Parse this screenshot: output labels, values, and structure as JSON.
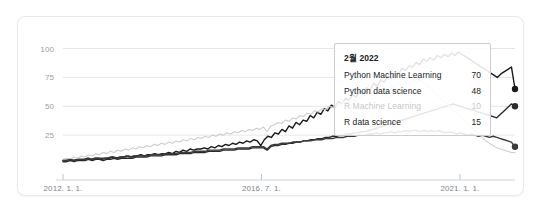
{
  "chart_data": {
    "type": "line",
    "title": "",
    "xlabel": "",
    "ylabel": "",
    "ylim": [
      0,
      110
    ],
    "grid": true,
    "legend_position": "tooltip",
    "y_ticks": [
      {
        "label": "100",
        "value": 100
      },
      {
        "label": "75",
        "value": 75
      },
      {
        "label": "50",
        "value": 50
      },
      {
        "label": "25",
        "value": 25
      }
    ],
    "x_ticks": [
      {
        "label": "2012. 1. 1.",
        "value": 0
      },
      {
        "label": "2016. 7. 1.",
        "value": 54
      },
      {
        "label": "2021. 1. 1.",
        "value": 108
      }
    ],
    "x_range": [
      0,
      123
    ],
    "series": [
      {
        "name": "Python Machine Learning",
        "color": "#1a1a1a",
        "endpoint_marker": true,
        "values": [
          3,
          3,
          4,
          3,
          4,
          4,
          4,
          5,
          4,
          5,
          5,
          4,
          5,
          5,
          6,
          5,
          6,
          6,
          7,
          6,
          7,
          7,
          8,
          7,
          8,
          8,
          9,
          8,
          9,
          9,
          10,
          9,
          11,
          10,
          12,
          11,
          13,
          12,
          13,
          13,
          14,
          13,
          15,
          14,
          16,
          15,
          17,
          16,
          18,
          17,
          19,
          18,
          20,
          19,
          21,
          20,
          16,
          21,
          24,
          23,
          27,
          26,
          30,
          28,
          33,
          31,
          36,
          34,
          38,
          37,
          42,
          40,
          45,
          43,
          48,
          46,
          51,
          49,
          54,
          52,
          57,
          55,
          60,
          58,
          63,
          61,
          66,
          64,
          70,
          67,
          73,
          71,
          76,
          74,
          80,
          78,
          83,
          81,
          85,
          84,
          88,
          86,
          91,
          89,
          92,
          90,
          94,
          92,
          95,
          93,
          96,
          94,
          97,
          95,
          93,
          91,
          89,
          87,
          85,
          83,
          81,
          79,
          77,
          75,
          78,
          80,
          82,
          84,
          65
        ]
      },
      {
        "name": "Python data science",
        "color": "#2b2b2b",
        "endpoint_marker": true,
        "values": [
          2,
          2,
          3,
          2,
          3,
          3,
          3,
          4,
          3,
          4,
          4,
          3,
          4,
          4,
          5,
          4,
          5,
          5,
          5,
          5,
          6,
          6,
          6,
          6,
          7,
          7,
          7,
          7,
          8,
          8,
          8,
          8,
          9,
          9,
          9,
          9,
          10,
          10,
          10,
          10,
          11,
          11,
          11,
          11,
          12,
          12,
          12,
          12,
          13,
          13,
          13,
          13,
          14,
          14,
          14,
          14,
          12,
          15,
          16,
          16,
          17,
          17,
          18,
          18,
          19,
          19,
          20,
          20,
          21,
          21,
          22,
          22,
          23,
          23,
          24,
          24,
          25,
          25,
          26,
          26,
          27,
          27,
          28,
          28,
          29,
          30,
          31,
          32,
          33,
          34,
          35,
          36,
          37,
          38,
          39,
          40,
          41,
          42,
          43,
          44,
          45,
          46,
          47,
          48,
          49,
          50,
          51,
          52,
          51,
          50,
          49,
          48,
          47,
          46,
          45,
          44,
          43,
          42,
          41,
          40,
          43,
          46,
          49,
          52,
          50
        ]
      },
      {
        "name": "R Machine Learning",
        "color": "#cdcdcd",
        "endpoint_marker": false,
        "values": [
          4,
          5,
          4,
          6,
          5,
          7,
          6,
          8,
          7,
          9,
          8,
          10,
          9,
          11,
          10,
          12,
          11,
          13,
          12,
          14,
          13,
          15,
          14,
          16,
          15,
          17,
          16,
          18,
          17,
          19,
          18,
          20,
          19,
          21,
          20,
          22,
          21,
          23,
          22,
          24,
          23,
          25,
          24,
          26,
          25,
          27,
          26,
          28,
          27,
          29,
          28,
          30,
          29,
          31,
          30,
          32,
          28,
          33,
          34,
          36,
          35,
          38,
          37,
          40,
          39,
          42,
          41,
          44,
          43,
          46,
          45,
          48,
          47,
          50,
          49,
          52,
          51,
          54,
          53,
          56,
          55,
          58,
          57,
          60,
          62,
          59,
          64,
          61,
          66,
          63,
          68,
          65,
          70,
          67,
          72,
          69,
          74,
          71,
          73,
          70,
          68,
          65,
          62,
          59,
          56,
          53,
          50,
          47,
          44,
          41,
          38,
          35,
          32,
          29,
          26,
          23,
          20,
          18,
          16,
          14,
          13,
          12,
          11,
          10,
          10
        ]
      },
      {
        "name": "R data science",
        "color": "#3a3a3a",
        "endpoint_marker": true,
        "values": [
          3,
          3,
          4,
          3,
          4,
          4,
          4,
          5,
          4,
          5,
          5,
          5,
          5,
          6,
          6,
          5,
          6,
          6,
          7,
          6,
          7,
          7,
          7,
          7,
          8,
          8,
          8,
          8,
          9,
          9,
          9,
          9,
          10,
          10,
          10,
          10,
          11,
          11,
          11,
          11,
          12,
          12,
          12,
          12,
          13,
          13,
          13,
          13,
          14,
          14,
          14,
          14,
          15,
          15,
          15,
          15,
          13,
          16,
          17,
          17,
          18,
          18,
          18,
          19,
          19,
          19,
          20,
          20,
          20,
          21,
          21,
          21,
          22,
          22,
          22,
          23,
          23,
          23,
          24,
          24,
          24,
          25,
          25,
          25,
          26,
          26,
          27,
          26,
          27,
          27,
          28,
          27,
          28,
          28,
          29,
          28,
          29,
          29,
          28,
          29,
          28,
          29,
          28,
          29,
          28,
          27,
          28,
          27,
          26,
          27,
          26,
          25,
          26,
          25,
          24,
          25,
          24,
          23,
          24,
          23,
          22,
          21,
          20,
          19,
          15
        ]
      }
    ]
  },
  "tooltip": {
    "title": "2월 2022",
    "rows": [
      {
        "name": "Python Machine Learning",
        "value": "70",
        "faded": false
      },
      {
        "name": "Python data science",
        "value": "48",
        "faded": false
      },
      {
        "name": "R Machine Learning",
        "value": "10",
        "faded": true
      },
      {
        "name": "R data science",
        "value": "15",
        "faded": false
      }
    ]
  }
}
